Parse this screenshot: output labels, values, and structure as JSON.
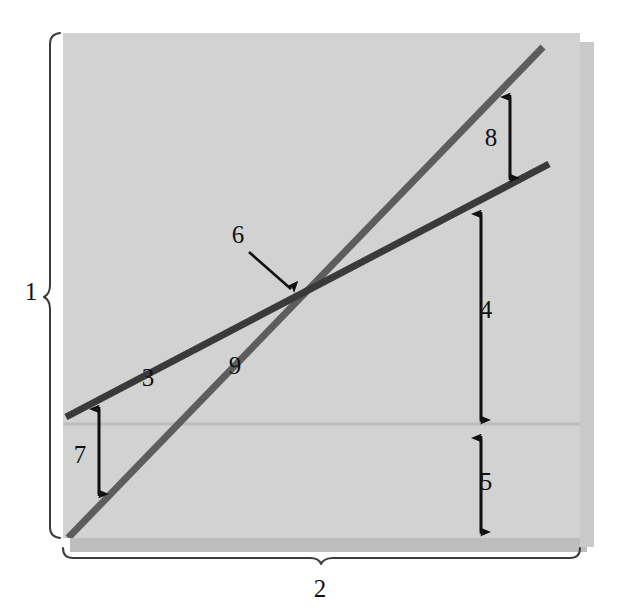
{
  "figure": {
    "type": "economics-line-diagram",
    "background_color": "#ffffff",
    "panel": {
      "fill_color": "#d2d2d2",
      "x": 63,
      "y": 33,
      "width": 517,
      "height": 505
    },
    "axis_braces": [
      {
        "name": "vertical-axis-brace",
        "label": "1",
        "orientation": "vertical",
        "label_x": 31,
        "label_y": 300,
        "from_y": 33,
        "to_y": 538,
        "x": 50
      },
      {
        "name": "horizontal-axis-brace",
        "label": "2",
        "orientation": "horizontal",
        "label_x": 320,
        "label_y": 597,
        "from_x": 63,
        "to_x": 580,
        "y": 557
      }
    ],
    "lines": [
      {
        "name": "line-3",
        "label": "3",
        "color": "#3a3a3a",
        "stroke_width": 7,
        "x1": 66,
        "y1": 417,
        "x2": 549,
        "y2": 164,
        "label_x": 148,
        "label_y": 386,
        "description": "flatter dark line"
      },
      {
        "name": "line-9",
        "label": "9",
        "color": "#5d5d5d",
        "stroke_width": 7,
        "x1": 68,
        "y1": 538,
        "x2": 543,
        "y2": 47,
        "label_x": 235,
        "label_y": 374,
        "description": "steeper gray line"
      }
    ],
    "reference_line": {
      "name": "horizontal-reference-line",
      "color": "#bcbcbc",
      "y": 424,
      "x1": 63,
      "x2": 580
    },
    "intersection": {
      "name": "intersection-point",
      "x": 299,
      "y": 297
    },
    "callouts": [
      {
        "name": "callout-6",
        "label": "6",
        "label_x": 238,
        "label_y": 243,
        "arrow_from_x": 249,
        "arrow_from_y": 252,
        "arrow_to_x": 293,
        "arrow_to_y": 291
      }
    ],
    "dimension_arrows": [
      {
        "name": "dimension-arrow-8",
        "label": "8",
        "x": 510,
        "top_y": 95,
        "bottom_y": 180,
        "label_x": 491,
        "label_y": 146,
        "heads": "both",
        "spans": "between line-9 and line-3"
      },
      {
        "name": "dimension-arrow-4",
        "label": "4",
        "x": 481,
        "top_y": 212,
        "bottom_y": 422,
        "label_x": 486,
        "label_y": 318,
        "heads": "both",
        "spans": "between line-3 and reference line"
      },
      {
        "name": "dimension-arrow-5",
        "label": "5",
        "x": 481,
        "top_y": 436,
        "bottom_y": 534,
        "label_x": 486,
        "label_y": 490,
        "heads": "both",
        "spans": "between reference line and panel bottom"
      },
      {
        "name": "dimension-arrow-7",
        "label": "7",
        "x": 99,
        "top_y": 407,
        "bottom_y": 496,
        "label_x": 80,
        "label_y": 463,
        "heads": "both",
        "spans": "between line-3 and line-9"
      }
    ]
  }
}
